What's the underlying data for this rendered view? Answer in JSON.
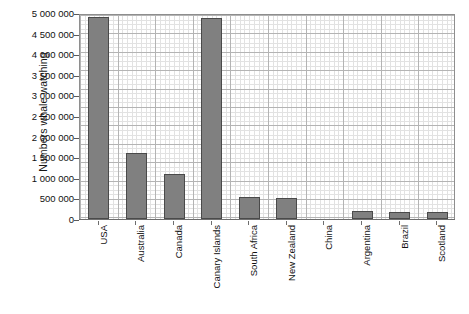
{
  "chart_data": {
    "type": "bar",
    "title": "",
    "xlabel": "",
    "ylabel": "Numbers whale watching",
    "ylim": [
      0,
      5000000
    ],
    "ytick_step": 500000,
    "grid": true,
    "legend": "none",
    "bar_color": "#808080",
    "bar_border_color": "#4a4a4a",
    "grid_major_color": "#b4b4b4",
    "grid_minor_color": "#e2e2e2",
    "axis_color": "#8e8e8e",
    "categories": [
      "USA",
      "Australia",
      "Canada",
      "Canary Islands",
      "South Africa",
      "New Zealand",
      "China",
      "Argentina",
      "Brazil",
      "Scotland"
    ],
    "values": [
      4900000,
      1600000,
      1100000,
      4890000,
      540000,
      510000,
      0,
      190000,
      180000,
      170000
    ],
    "ytick_labels": [
      "5 000 000",
      "4 500 000",
      "4 000 000",
      "3 500 000",
      "3 000 000",
      "2 500 000",
      "2 000 000",
      "1 500 000",
      "1 000 000",
      "500 000",
      "0"
    ],
    "ytick_values": [
      5000000,
      4500000,
      4000000,
      3500000,
      3000000,
      2500000,
      2000000,
      1500000,
      1000000,
      500000,
      0
    ]
  }
}
